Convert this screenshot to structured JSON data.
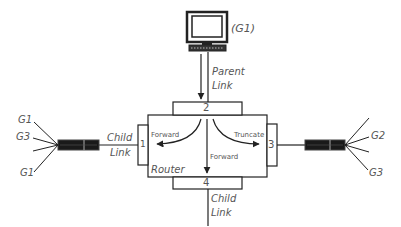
{
  "diagram": {
    "type": "router-multicast",
    "nodes": {
      "computer": {
        "label": "(G1)"
      },
      "router": {
        "label": "Router"
      },
      "left_host_bundle": {
        "labels": [
          "G1",
          "G3",
          "G1"
        ]
      },
      "right_host_bundle": {
        "labels": [
          "G2",
          "G3"
        ]
      }
    },
    "ports": [
      {
        "id": "port-1",
        "label": "1"
      },
      {
        "id": "port-2",
        "label": "2"
      },
      {
        "id": "port-3",
        "label": "3"
      },
      {
        "id": "port-4",
        "label": "4"
      }
    ],
    "links": {
      "parent": {
        "line1": "Parent",
        "line2": "Link"
      },
      "child_left": {
        "line1": "Child",
        "line2": "Link"
      },
      "child_bottom": {
        "line1": "Child",
        "line2": "Link"
      }
    },
    "actions": {
      "forward_left": "Forward",
      "forward_down": "Forward",
      "truncate_right": "Truncate"
    },
    "colors": {
      "line": "#333333",
      "text": "#555555",
      "cable": "#1a1a1a",
      "background": "#ffffff"
    }
  }
}
